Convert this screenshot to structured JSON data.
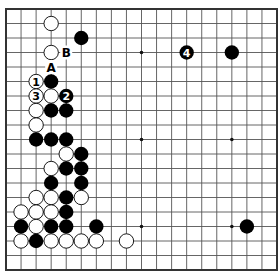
{
  "board": {
    "size": 19,
    "left": 6,
    "top": 9,
    "right": 277,
    "bottom": 270,
    "line_color": "#555555",
    "border_color": "#333333",
    "background": "#ffffff",
    "hoshi": [
      [
        9,
        3
      ],
      [
        15,
        3
      ],
      [
        3,
        3
      ],
      [
        3,
        9
      ],
      [
        9,
        9
      ],
      [
        15,
        9
      ],
      [
        3,
        15
      ],
      [
        9,
        15
      ],
      [
        15,
        15
      ]
    ]
  },
  "stones": [
    {
      "color": "white",
      "col": 3,
      "row": 1
    },
    {
      "color": "black",
      "col": 5,
      "row": 2
    },
    {
      "color": "white",
      "col": 3,
      "row": 3
    },
    {
      "color": "black",
      "col": 12,
      "row": 3,
      "label": "4"
    },
    {
      "color": "black",
      "col": 15,
      "row": 3
    },
    {
      "color": "white",
      "col": 2,
      "row": 5,
      "label": "1"
    },
    {
      "color": "black",
      "col": 3,
      "row": 5
    },
    {
      "color": "white",
      "col": 2,
      "row": 6,
      "label": "3"
    },
    {
      "color": "white",
      "col": 3,
      "row": 6
    },
    {
      "color": "black",
      "col": 4,
      "row": 6,
      "label": "2"
    },
    {
      "color": "white",
      "col": 2,
      "row": 7
    },
    {
      "color": "black",
      "col": 3,
      "row": 7
    },
    {
      "color": "black",
      "col": 4,
      "row": 7
    },
    {
      "color": "white",
      "col": 2,
      "row": 8
    },
    {
      "color": "black",
      "col": 2,
      "row": 9
    },
    {
      "color": "black",
      "col": 3,
      "row": 9
    },
    {
      "color": "black",
      "col": 4,
      "row": 9
    },
    {
      "color": "white",
      "col": 4,
      "row": 10
    },
    {
      "color": "black",
      "col": 5,
      "row": 10
    },
    {
      "color": "white",
      "col": 3,
      "row": 11
    },
    {
      "color": "black",
      "col": 4,
      "row": 11
    },
    {
      "color": "black",
      "col": 5,
      "row": 11
    },
    {
      "color": "black",
      "col": 3,
      "row": 12
    },
    {
      "color": "black",
      "col": 5,
      "row": 12
    },
    {
      "color": "white",
      "col": 2,
      "row": 13
    },
    {
      "color": "white",
      "col": 3,
      "row": 13
    },
    {
      "color": "black",
      "col": 4,
      "row": 13
    },
    {
      "color": "white",
      "col": 5,
      "row": 13
    },
    {
      "color": "white",
      "col": 1,
      "row": 14
    },
    {
      "color": "white",
      "col": 2,
      "row": 14
    },
    {
      "color": "white",
      "col": 3,
      "row": 14
    },
    {
      "color": "black",
      "col": 4,
      "row": 14
    },
    {
      "color": "black",
      "col": 1,
      "row": 15
    },
    {
      "color": "white",
      "col": 2,
      "row": 15
    },
    {
      "color": "black",
      "col": 3,
      "row": 15
    },
    {
      "color": "black",
      "col": 4,
      "row": 15
    },
    {
      "color": "black",
      "col": 6,
      "row": 15
    },
    {
      "color": "black",
      "col": 16,
      "row": 15
    },
    {
      "color": "white",
      "col": 1,
      "row": 16
    },
    {
      "color": "black",
      "col": 2,
      "row": 16
    },
    {
      "color": "white",
      "col": 3,
      "row": 16
    },
    {
      "color": "white",
      "col": 4,
      "row": 16
    },
    {
      "color": "white",
      "col": 5,
      "row": 16
    },
    {
      "color": "white",
      "col": 6,
      "row": 16
    },
    {
      "color": "white",
      "col": 8,
      "row": 16
    }
  ],
  "marks": [
    {
      "label": "A",
      "col": 3,
      "row": 4
    },
    {
      "label": "B",
      "col": 4,
      "row": 3
    }
  ]
}
